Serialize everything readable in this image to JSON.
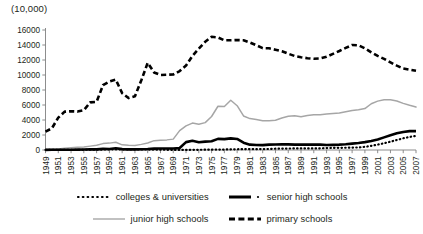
{
  "chart": {
    "unit_label": "(10,000)",
    "title": ""
  },
  "axes": {
    "y_ticks": [
      "0",
      "2000",
      "4000",
      "6000",
      "8000",
      "10000",
      "12000",
      "14000",
      "16000"
    ],
    "y_min": 0,
    "y_max": 16000,
    "x_ticks": [
      "1949",
      "1951",
      "1953",
      "1955",
      "1957",
      "1959",
      "1961",
      "1963",
      "1965",
      "1967",
      "1969",
      "1971",
      "1973",
      "1975",
      "1977",
      "1979",
      "1981",
      "1983",
      "1985",
      "1987",
      "1989",
      "1991",
      "1993",
      "1995",
      "1997",
      "1999",
      "2001",
      "2003",
      "2005",
      "2007"
    ]
  },
  "legend": {
    "rows": [
      [
        {
          "label": "colleges & universities",
          "style": "dotted",
          "color": "#000000"
        },
        {
          "label": "senior high schools",
          "style": "solid-thick",
          "color": "#000000"
        }
      ],
      [
        {
          "label": "junior high schools",
          "style": "solid-gray",
          "color": "#a6a6a6"
        },
        {
          "label": "primary schools",
          "style": "dashed",
          "color": "#000000"
        }
      ]
    ]
  },
  "colors": {
    "primary_schools": "#000000",
    "junior_high_schools": "#a6a6a6",
    "senior_high_schools": "#000000",
    "colleges_universities": "#000000",
    "axis": "#808080",
    "text": "#231f20"
  },
  "chart_data": {
    "type": "line",
    "title": "",
    "subtitle": "",
    "xlabel": "",
    "ylabel": "(10,000)",
    "ylim": [
      0,
      16000
    ],
    "grid": false,
    "legend_position": "bottom",
    "x": [
      1949,
      1950,
      1951,
      1952,
      1953,
      1954,
      1955,
      1956,
      1957,
      1958,
      1959,
      1960,
      1961,
      1962,
      1963,
      1964,
      1965,
      1966,
      1967,
      1968,
      1969,
      1970,
      1971,
      1972,
      1973,
      1974,
      1975,
      1976,
      1977,
      1978,
      1979,
      1980,
      1981,
      1982,
      1983,
      1984,
      1985,
      1986,
      1987,
      1988,
      1989,
      1990,
      1991,
      1992,
      1993,
      1994,
      1995,
      1996,
      1997,
      1998,
      1999,
      2000,
      2001,
      2002,
      2003,
      2004,
      2005,
      2006,
      2007
    ],
    "series": [
      {
        "name": "primary schools",
        "style": "dashed",
        "color": "#000000",
        "values": [
          2439,
          2892,
          4315,
          5110,
          5166,
          5122,
          5312,
          6347,
          6428,
          8640,
          9118,
          9379,
          7579,
          6924,
          7158,
          9294,
          11621,
          10342,
          10000,
          10036,
          10067,
          10528,
          11254,
          12549,
          13520,
          14425,
          15094,
          15000,
          14624,
          14624,
          14663,
          14627,
          14333,
          13972,
          13578,
          13557,
          13370,
          13177,
          12836,
          12536,
          12373,
          12241,
          12164,
          12201,
          12421,
          12823,
          13195,
          13615,
          13995,
          13954,
          13548,
          13013,
          12543,
          12157,
          11690,
          11246,
          10864,
          10712,
          10564
        ]
      },
      {
        "name": "junior high schools",
        "style": "solid",
        "color": "#a6a6a6",
        "values": [
          83,
          104,
          131,
          223,
          293,
          358,
          390,
          516,
          628,
          852,
          918,
          1026,
          689,
          618,
          604,
          751,
          933,
          1250,
          1300,
          1350,
          1450,
          2582,
          3222,
          3587,
          3446,
          3650,
          4466,
          5836,
          5802,
          6637,
          5905,
          4538,
          4185,
          4074,
          3911,
          3898,
          3965,
          4256,
          4492,
          4580,
          4438,
          4586,
          4705,
          4715,
          4789,
          4859,
          4930,
          5100,
          5275,
          5358,
          5519,
          6167,
          6514,
          6688,
          6695,
          6528,
          6215,
          5958,
          5736
        ]
      },
      {
        "name": "senior high schools",
        "style": "solid-thick",
        "color": "#000000",
        "values": [
          20,
          24,
          26,
          26,
          37,
          46,
          58,
          77,
          78,
          147,
          133,
          236,
          121,
          85,
          87,
          101,
          131,
          180,
          190,
          200,
          210,
          262,
          1050,
          1224,
          1036,
          1117,
          1163,
          1483,
          1447,
          1553,
          1468,
          969,
          715,
          674,
          654,
          718,
          741,
          756,
          747,
          717,
          713,
          713,
          717,
          721,
          657,
          682,
          713,
          769,
          850,
          938,
          1050,
          1201,
          1405,
          1684,
          1965,
          2220,
          2409,
          2514,
          2522
        ]
      },
      {
        "name": "colleges & universities",
        "style": "dotted",
        "color": "#000000",
        "values": [
          12,
          13,
          15,
          19,
          21,
          25,
          29,
          40,
          44,
          66,
          81,
          96,
          95,
          83,
          75,
          69,
          67,
          53,
          41,
          26,
          11,
          4,
          8,
          23,
          31,
          43,
          50,
          56,
          63,
          86,
          102,
          114,
          128,
          115,
          120,
          140,
          170,
          188,
          196,
          206,
          208,
          206,
          204,
          218,
          254,
          280,
          290,
          302,
          317,
          341,
          413,
          556,
          719,
          903,
          1109,
          1334,
          1562,
          1739,
          1885
        ]
      }
    ]
  }
}
